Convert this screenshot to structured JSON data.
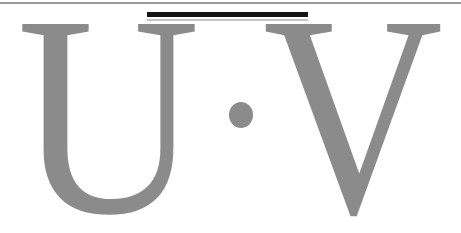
{
  "expression": {
    "text": "U·V",
    "letter_u": "U",
    "middle_dot": "·",
    "letter_v": "V"
  },
  "colors": {
    "letter_gray": "#8B8B8B",
    "bar_black": "#151515",
    "top_rule_gray": "#9A9A9A",
    "thin_rule_gray": "#C4C4C4",
    "background": "#FFFFFF"
  }
}
